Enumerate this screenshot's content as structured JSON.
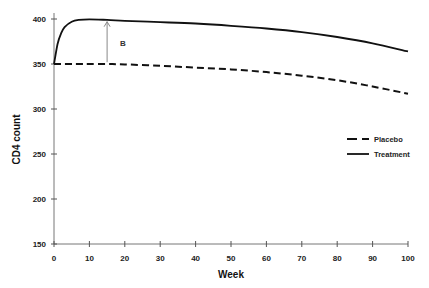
{
  "chart_data": {
    "type": "line",
    "title": "",
    "xlabel": "Week",
    "ylabel": "CD4 count",
    "xlim": [
      0,
      100
    ],
    "ylim": [
      150,
      400
    ],
    "xticks": [
      0,
      10,
      20,
      30,
      40,
      50,
      60,
      70,
      80,
      90,
      100
    ],
    "yticks": [
      150,
      200,
      250,
      300,
      350,
      400
    ],
    "grid": false,
    "legend_position": "right-middle",
    "x": [
      0,
      1,
      2,
      3,
      5,
      7,
      10,
      15,
      20,
      30,
      40,
      50,
      60,
      70,
      80,
      90,
      100
    ],
    "series": [
      {
        "name": "Placebo",
        "style": "dashed",
        "values": [
          350,
          350,
          350,
          350,
          350,
          350,
          350,
          350,
          349.5,
          348,
          346,
          344,
          341,
          337,
          332,
          325,
          317
        ]
      },
      {
        "name": "Treatment",
        "style": "solid",
        "values": [
          350,
          372,
          384,
          391,
          397,
          399,
          399.5,
          399,
          398,
          396.5,
          395,
          392.5,
          389.5,
          385.5,
          380,
          373,
          364
        ]
      }
    ],
    "annotations": [
      {
        "type": "arrow",
        "label": "B",
        "x": 15,
        "y_from": 352,
        "y_to": 397,
        "label_x": 20,
        "label_y": 375
      }
    ]
  }
}
